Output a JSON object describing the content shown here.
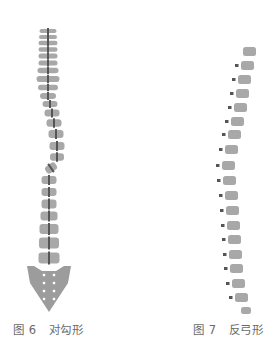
{
  "figures": [
    {
      "id": "fig6",
      "caption_prefix": "图 6",
      "caption_title": "对勾形",
      "colors": {
        "vertebra": "#a8a8a8",
        "cord": "#555555",
        "sacrum": "#9c9c9c",
        "foramen": "#ffffff"
      },
      "vertebrae": [
        {
          "cx": 48,
          "cy": 31,
          "w": 17,
          "h": 4,
          "rot": 0
        },
        {
          "cx": 48,
          "cy": 37,
          "w": 18,
          "h": 4,
          "rot": 0
        },
        {
          "cx": 48,
          "cy": 43,
          "w": 19,
          "h": 4.5,
          "rot": 0
        },
        {
          "cx": 48,
          "cy": 49.5,
          "w": 19,
          "h": 4.5,
          "rot": 0
        },
        {
          "cx": 48,
          "cy": 56,
          "w": 19,
          "h": 5,
          "rot": 0
        },
        {
          "cx": 48,
          "cy": 63,
          "w": 19,
          "h": 5,
          "rot": 0
        },
        {
          "cx": 48,
          "cy": 70.5,
          "w": 21,
          "h": 5.5,
          "rot": 0
        },
        {
          "cx": 48,
          "cy": 79,
          "w": 23,
          "h": 6,
          "rot": 0
        },
        {
          "cx": 48,
          "cy": 87.5,
          "w": 20,
          "h": 5.5,
          "rot": 0
        },
        {
          "cx": 48,
          "cy": 96,
          "w": 16,
          "h": 6,
          "rot": 0
        },
        {
          "cx": 50,
          "cy": 104,
          "w": 15,
          "h": 6,
          "rot": 0
        },
        {
          "cx": 52,
          "cy": 113,
          "w": 15,
          "h": 7,
          "rot": 0
        },
        {
          "cx": 54,
          "cy": 123,
          "w": 15,
          "h": 7.5,
          "rot": 0
        },
        {
          "cx": 56,
          "cy": 134,
          "w": 15,
          "h": 8,
          "rot": 0
        },
        {
          "cx": 57,
          "cy": 146,
          "w": 15,
          "h": 8,
          "rot": 0
        },
        {
          "cx": 57,
          "cy": 157,
          "w": 14,
          "h": 7.5,
          "rot": 0
        },
        {
          "cx": 51,
          "cy": 168,
          "w": 12,
          "h": 8,
          "rot": -35
        },
        {
          "cx": 49,
          "cy": 180,
          "w": 15,
          "h": 8,
          "rot": 0
        },
        {
          "cx": 49,
          "cy": 192,
          "w": 15,
          "h": 8,
          "rot": 0
        },
        {
          "cx": 49,
          "cy": 204,
          "w": 15,
          "h": 9,
          "rot": 0
        },
        {
          "cx": 49,
          "cy": 216,
          "w": 17,
          "h": 9,
          "rot": 0
        },
        {
          "cx": 49,
          "cy": 229,
          "w": 19,
          "h": 10,
          "rot": 0
        },
        {
          "cx": 49,
          "cy": 243,
          "w": 20,
          "h": 11,
          "rot": 0
        },
        {
          "cx": 49,
          "cy": 258,
          "w": 21,
          "h": 11,
          "rot": 0
        }
      ],
      "sacrum": {
        "points": "27,266 34,266 42,271 56,271 64,266 71,266 68,283 49,312 30,283",
        "foramina": [
          [
            44,
            275
          ],
          [
            54,
            275
          ],
          [
            44,
            283
          ],
          [
            54,
            283
          ],
          [
            44,
            291
          ],
          [
            54,
            291
          ],
          [
            44,
            299
          ],
          [
            54,
            299
          ]
        ]
      }
    },
    {
      "id": "fig7",
      "caption_prefix": "图 7",
      "caption_title": "反弓形",
      "colors": {
        "vertebra": "#a8a8a8",
        "process": "#555555"
      },
      "vertebrae": [
        {
          "x": 243,
          "y": 47,
          "w": 13,
          "h": 9
        },
        {
          "x": 241,
          "y": 61,
          "w": 13,
          "h": 9
        },
        {
          "x": 238,
          "y": 75,
          "w": 13,
          "h": 9
        },
        {
          "x": 236,
          "y": 89,
          "w": 13,
          "h": 9
        },
        {
          "x": 234,
          "y": 103,
          "w": 13,
          "h": 9
        },
        {
          "x": 231,
          "y": 117,
          "w": 13,
          "h": 9
        },
        {
          "x": 228,
          "y": 130,
          "w": 13,
          "h": 9
        },
        {
          "x": 225,
          "y": 145,
          "w": 13,
          "h": 9
        },
        {
          "x": 222,
          "y": 161,
          "w": 13,
          "h": 9
        },
        {
          "x": 223,
          "y": 176,
          "w": 13,
          "h": 9
        },
        {
          "x": 225,
          "y": 191,
          "w": 13,
          "h": 9
        },
        {
          "x": 226,
          "y": 206,
          "w": 13,
          "h": 9
        },
        {
          "x": 227,
          "y": 221,
          "w": 13,
          "h": 9
        },
        {
          "x": 228,
          "y": 235,
          "w": 13,
          "h": 9
        },
        {
          "x": 229,
          "y": 250,
          "w": 13,
          "h": 9
        },
        {
          "x": 230,
          "y": 264,
          "w": 13,
          "h": 9
        },
        {
          "x": 232,
          "y": 279,
          "w": 13,
          "h": 9
        },
        {
          "x": 235,
          "y": 293,
          "w": 13,
          "h": 9
        },
        {
          "x": 241,
          "y": 307,
          "w": 10,
          "h": 7
        }
      ]
    }
  ]
}
